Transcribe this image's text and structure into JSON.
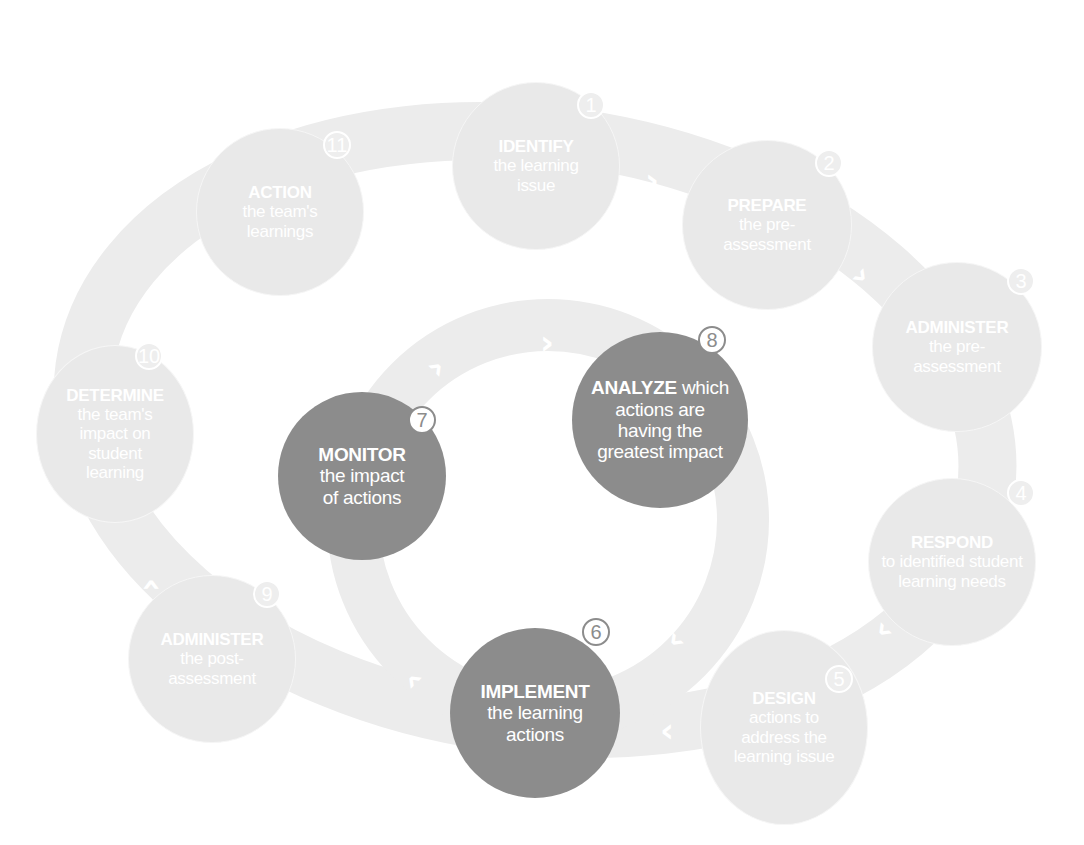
{
  "colors": {
    "band": "#ececec",
    "light_node": "#e9e9e9",
    "dark_node": "#8c8c8c",
    "text": "#ffffff"
  },
  "outer_cycle": [
    {
      "num": "1",
      "title": "IDENTIFY",
      "rest": "the learning issue"
    },
    {
      "num": "2",
      "title": "PREPARE",
      "rest": "the pre-assessment"
    },
    {
      "num": "3",
      "title": "ADMINISTER",
      "rest": "the pre-assessment"
    },
    {
      "num": "4",
      "title": "RESPOND",
      "rest": "to identified student learning needs"
    },
    {
      "num": "5",
      "title": "DESIGN",
      "rest": "actions to address the learning issue"
    },
    {
      "num": "9",
      "title": "ADMINISTER",
      "rest": "the post-assessment"
    },
    {
      "num": "10",
      "title": "DETERMINE",
      "rest": "the team's impact on student learning"
    },
    {
      "num": "11",
      "title": "ACTION",
      "rest": "the team's learnings"
    }
  ],
  "inner_cycle": [
    {
      "num": "6",
      "title": "IMPLEMENT",
      "rest": "the learning actions"
    },
    {
      "num": "7",
      "title": "MONITOR",
      "rest": "the impact of actions"
    },
    {
      "num": "8",
      "title": "ANALYZE",
      "rest": "which actions are having the greatest impact"
    }
  ],
  "arrows": {
    "glyph": "›"
  }
}
